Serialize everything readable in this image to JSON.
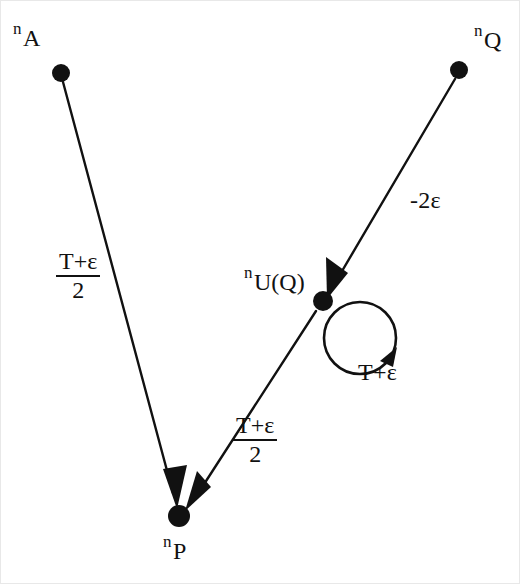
{
  "figure": {
    "type": "directed-graph",
    "background_color": "#ffffff",
    "stroke_color": "#111111"
  },
  "nodes": [
    {
      "id": "nA",
      "name": "node-n-a",
      "label_prefix": "n",
      "label_subscript": "A",
      "cx": 60,
      "cy": 72,
      "r": 9,
      "label_x": 12,
      "label_y": 18
    },
    {
      "id": "nQ",
      "name": "node-n-q",
      "label_prefix": "n",
      "label_subscript": "Q",
      "cx": 458,
      "cy": 69,
      "r": 9,
      "label_x": 473,
      "label_y": 20
    },
    {
      "id": "nUQ",
      "name": "node-n-u-q",
      "label_prefix": "n",
      "label_subscript": "U(Q)",
      "cx": 322,
      "cy": 300,
      "r": 10,
      "label_x": 243,
      "label_y": 262
    },
    {
      "id": "nP",
      "name": "node-n-p",
      "label_prefix": "n",
      "label_subscript": "P",
      "cx": 178,
      "cy": 515,
      "r": 11,
      "label_x": 162,
      "label_y": 531
    }
  ],
  "edges": [
    {
      "id": "e-a-p",
      "name": "edge-n-a-to-n-p",
      "from": "nA",
      "to": "nP",
      "label_kind": "fraction",
      "numerator": "T+ε",
      "denominator": "2",
      "label_x": 55,
      "label_y": 248
    },
    {
      "id": "e-q-uq",
      "name": "edge-n-q-to-n-u-q",
      "from": "nQ",
      "to": "nUQ",
      "label_kind": "plain",
      "label": "-2ε",
      "label_x": 409,
      "label_y": 186
    },
    {
      "id": "e-uq-p",
      "name": "edge-n-u-q-to-n-p",
      "from": "nUQ",
      "to": "nP",
      "label_kind": "fraction",
      "numerator": "T+ε",
      "denominator": "2",
      "label_x": 232,
      "label_y": 412
    },
    {
      "id": "e-uq-self",
      "name": "edge-n-u-q-self-loop",
      "from": "nUQ",
      "to": "nUQ",
      "label_kind": "plain",
      "label": "T+ε",
      "label_x": 357,
      "label_y": 358
    }
  ]
}
